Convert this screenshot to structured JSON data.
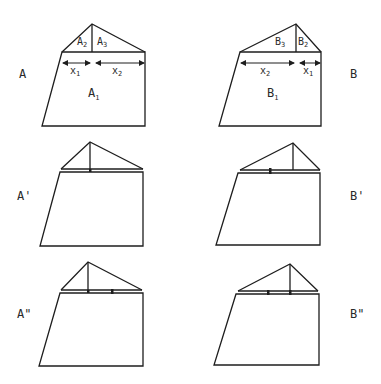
{
  "panels": {
    "A": {
      "label": "A",
      "main_area": "A",
      "main_area_sub": "1",
      "left_roof": "A",
      "left_roof_sub": "2",
      "right_roof": "A",
      "right_roof_sub": "3",
      "dim_left": "x",
      "dim_left_sub": "1",
      "dim_right": "x",
      "dim_right_sub": "2"
    },
    "B": {
      "label": "B",
      "main_area": "B",
      "main_area_sub": "1",
      "left_roof": "B",
      "left_roof_sub": "3",
      "right_roof": "B",
      "right_roof_sub": "2",
      "dim_left": "x",
      "dim_left_sub": "2",
      "dim_right": "x",
      "dim_right_sub": "1"
    },
    "A_prime": {
      "label": "A'"
    },
    "B_prime": {
      "label": "B'"
    },
    "A_double_prime": {
      "label": "A\""
    },
    "B_double_prime": {
      "label": "B\""
    }
  },
  "colors": {
    "stroke": "#1e1e1e",
    "background": "#ffffff"
  }
}
